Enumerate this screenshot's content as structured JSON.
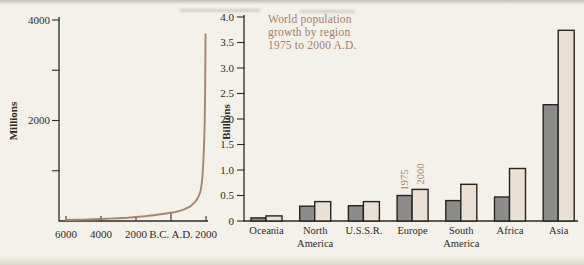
{
  "colors": {
    "background": "#f4f1ea",
    "ink": "#2e2b25",
    "accent_tan": "#a5806b",
    "curve_line": "#a8846e",
    "bar_1975_fill": "#8c8c8a",
    "bar_2000_fill": "#e9dfd3",
    "bar_outline": "#26241f"
  },
  "chart_data": [
    {
      "type": "line",
      "ylabel": "Millions",
      "ylim": [
        0,
        4000
      ],
      "y_ticks": [
        {
          "value": 1000,
          "label": ""
        },
        {
          "value": 2000,
          "label": "2000"
        },
        {
          "value": 3000,
          "label": ""
        },
        {
          "value": 4000,
          "label": "4000"
        }
      ],
      "x_ticks": [
        {
          "year": -6000,
          "label": "6000"
        },
        {
          "year": -4000,
          "label": "4000"
        },
        {
          "year": -2000,
          "label": "2000"
        },
        {
          "year": 0,
          "label": "B.C. A.D."
        },
        {
          "year": 2000,
          "label": "2000"
        }
      ],
      "xlim_years": [
        -6000,
        2075
      ],
      "points": [
        [
          -6000,
          20
        ],
        [
          -5500,
          24
        ],
        [
          -5000,
          28
        ],
        [
          -4500,
          33
        ],
        [
          -4000,
          40
        ],
        [
          -3500,
          47
        ],
        [
          -3000,
          55
        ],
        [
          -2500,
          66
        ],
        [
          -2000,
          80
        ],
        [
          -1500,
          95
        ],
        [
          -1000,
          115
        ],
        [
          -500,
          140
        ],
        [
          0,
          165
        ],
        [
          250,
          180
        ],
        [
          500,
          200
        ],
        [
          750,
          230
        ],
        [
          1000,
          270
        ],
        [
          1200,
          320
        ],
        [
          1400,
          390
        ],
        [
          1500,
          440
        ],
        [
          1600,
          510
        ],
        [
          1650,
          560
        ],
        [
          1700,
          620
        ],
        [
          1750,
          720
        ],
        [
          1800,
          900
        ],
        [
          1850,
          1200
        ],
        [
          1900,
          1650
        ],
        [
          1925,
          2000
        ],
        [
          1950,
          2550
        ],
        [
          1960,
          3000
        ],
        [
          1970,
          3600
        ],
        [
          1975,
          3720
        ]
      ]
    },
    {
      "type": "bar",
      "title": "World population growth by region 1975 to 2000 A.D.",
      "title_lines": [
        "World population",
        "growth by region",
        "1975 to 2000 A.D."
      ],
      "ylabel": "Billions",
      "ylim": [
        0,
        4
      ],
      "y_tick_labels": [
        "4.0",
        "3.5",
        "3.0",
        "2.5",
        "2.0",
        "1.5",
        "1.0",
        "0.5",
        "0"
      ],
      "categories": [
        "Oceania",
        "North America",
        "U.S.S.R.",
        "Europe",
        "South America",
        "Africa",
        "Asia"
      ],
      "series": [
        {
          "name": "1975",
          "values": [
            0.06,
            0.29,
            0.3,
            0.5,
            0.4,
            0.47,
            2.28
          ]
        },
        {
          "name": "2000",
          "values": [
            0.1,
            0.38,
            0.38,
            0.62,
            0.72,
            1.03,
            3.74
          ]
        }
      ],
      "series_label_anchor_category": "Europe",
      "legend_position": "rotated-above-Europe-bars"
    }
  ]
}
